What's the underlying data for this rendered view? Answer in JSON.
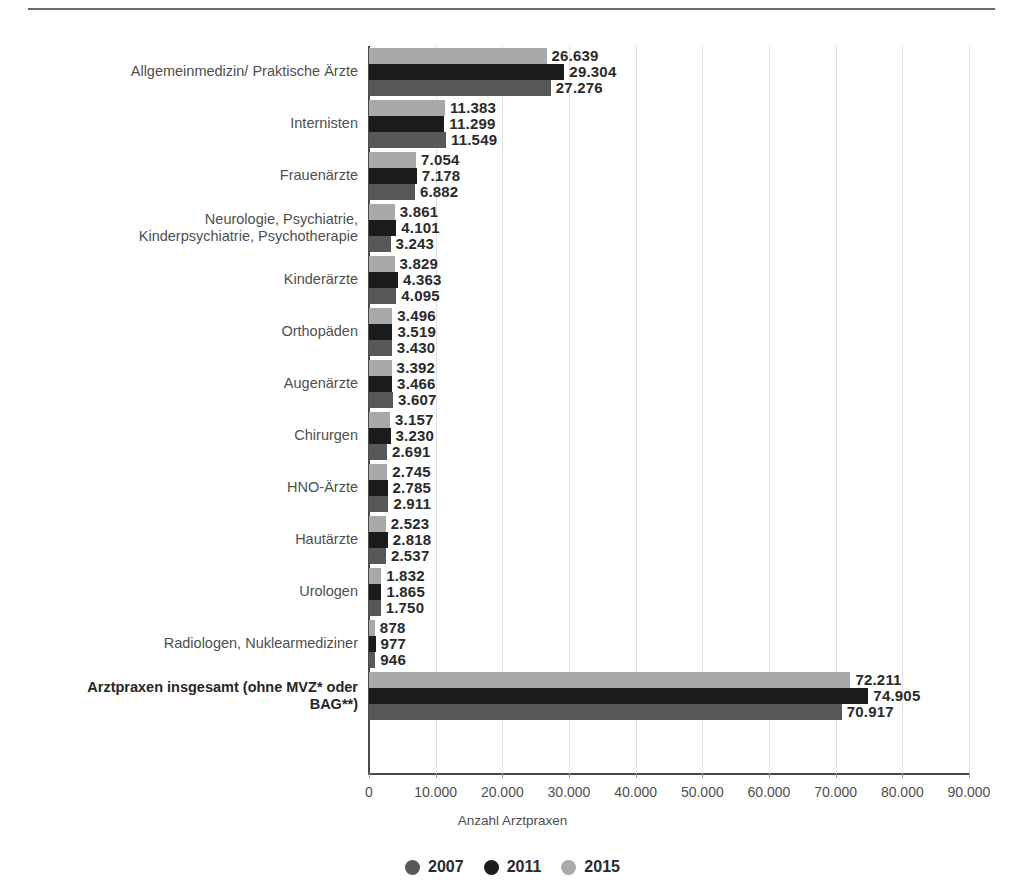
{
  "chart_data": {
    "type": "bar",
    "orientation": "horizontal",
    "title": "",
    "xlabel": "Anzahl Arztpraxen",
    "ylabel": "",
    "xlim": [
      0,
      90000
    ],
    "xticks": [
      "0",
      "10.000",
      "20.000",
      "30.000",
      "40.000",
      "50.000",
      "60.000",
      "70.000",
      "80.000",
      "90.000"
    ],
    "xtick_values": [
      0,
      10000,
      20000,
      30000,
      40000,
      50000,
      60000,
      70000,
      80000,
      90000
    ],
    "grid": true,
    "legend_position": "bottom",
    "series": [
      {
        "name": "2007",
        "color": "#585858",
        "values": [
          27276,
          11549,
          6882,
          3243,
          4095,
          3430,
          3607,
          2691,
          2911,
          2537,
          1750,
          946,
          70917
        ]
      },
      {
        "name": "2011",
        "color": "#1c1c1c",
        "values": [
          29304,
          11299,
          7178,
          4101,
          4363,
          3519,
          3466,
          3230,
          2785,
          2818,
          1865,
          977,
          74905
        ]
      },
      {
        "name": "2015",
        "color": "#a9a9a9",
        "values": [
          26639,
          11383,
          7054,
          3861,
          3829,
          3496,
          3392,
          3157,
          2745,
          2523,
          1832,
          878,
          72211
        ]
      }
    ],
    "categories": [
      "Allgemeinmedizin/ Praktische Ärzte",
      "Internisten",
      "Frauenärzte",
      "Neurologie, Psychiatrie,\nKinderpsychiatrie, Psychotherapie",
      "Kinderärzte",
      "Orthopäden",
      "Augenärzte",
      "Chirurgen",
      "HNO-Ärzte",
      "Hautärzte",
      "Urologen",
      "Radiologen, Nuklearmediziner",
      "Arztpraxen insgesamt (ohne MVZ* oder\nBAG**)"
    ],
    "bar_labels": [
      {
        "2015": "26.639",
        "2011": "29.304",
        "2007": "27.276"
      },
      {
        "2015": "11.383",
        "2011": "11.299",
        "2007": "11.549"
      },
      {
        "2015": "7.054",
        "2011": "7.178",
        "2007": "6.882"
      },
      {
        "2015": "3.861",
        "2011": "4.101",
        "2007": "3.243"
      },
      {
        "2015": "3.829",
        "2011": "4.363",
        "2007": "4.095"
      },
      {
        "2015": "3.496",
        "2011": "3.519",
        "2007": "3.430"
      },
      {
        "2015": "3.392",
        "2011": "3.466",
        "2007": "3.607"
      },
      {
        "2015": "3.157",
        "2011": "3.230",
        "2007": "2.691"
      },
      {
        "2015": "2.745",
        "2011": "2.785",
        "2007": "2.911"
      },
      {
        "2015": "2.523",
        "2011": "2.818",
        "2007": "2.537"
      },
      {
        "2015": "1.832",
        "2011": "1.865",
        "2007": "1.750"
      },
      {
        "2015": "878",
        "2011": "977",
        "2007": "946"
      },
      {
        "2015": "72.211",
        "2011": "74.905",
        "2007": "70.917"
      }
    ],
    "bold_categories": [
      12
    ],
    "legend": [
      {
        "label": "2007",
        "color": "#585858"
      },
      {
        "label": "2011",
        "color": "#1c1c1c"
      },
      {
        "label": "2015",
        "color": "#a9a9a9"
      }
    ]
  }
}
